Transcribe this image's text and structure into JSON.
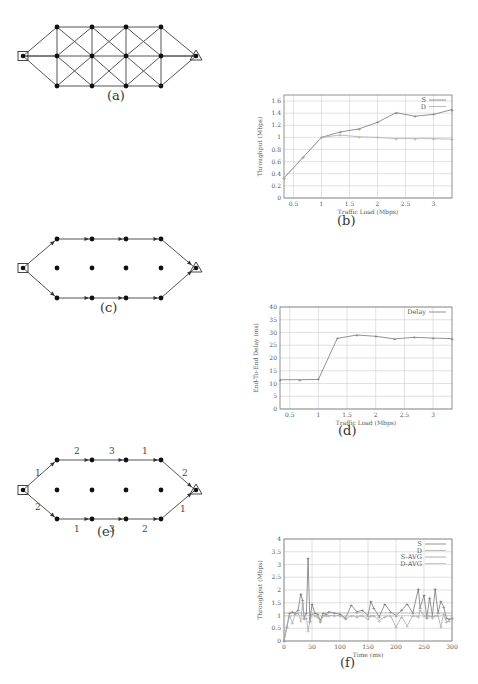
{
  "figure": {
    "panels": [
      {
        "id": "a",
        "caption": "(a)",
        "type": "diagram",
        "description": "Full mesh grid topology: source square, 3x4 relay nodes, destination triangle"
      },
      {
        "id": "b",
        "caption": "(b)",
        "type": "chart"
      },
      {
        "id": "c",
        "caption": "(c)",
        "type": "diagram",
        "description": "Two disjoint paths (upper and lower) from source to destination with directed edges"
      },
      {
        "id": "d",
        "caption": "(d)",
        "type": "chart"
      },
      {
        "id": "e",
        "caption": "(e)",
        "type": "diagram",
        "description": "Two paths with channel assignments on each link"
      },
      {
        "id": "f",
        "caption": "(f)",
        "type": "chart"
      }
    ],
    "diagram_e_labels": {
      "upper": [
        "1",
        "2",
        "3",
        "1",
        "2"
      ],
      "lower": [
        "2",
        "1",
        "3",
        "2",
        "1"
      ]
    }
  },
  "chart_data": [
    {
      "panel": "b",
      "type": "line",
      "title": "",
      "xlabel": "Traffic Load (Mbps)",
      "ylabel": "Throughput (Mbps)",
      "xlim": [
        0.33,
        3.33
      ],
      "ylim": [
        0,
        1.7
      ],
      "xticks": [
        "0.5",
        "1",
        "1.5",
        "2",
        "2.5",
        "3"
      ],
      "yticks": [
        "0",
        "0.2",
        "0.4",
        "0.6",
        "0.8",
        "1",
        "1.2",
        "1.4",
        "1.6"
      ],
      "grid": true,
      "legend_position": "top-right",
      "x": [
        0.33,
        0.67,
        1.0,
        1.33,
        1.67,
        2.0,
        2.33,
        2.67,
        3.0,
        3.33
      ],
      "series": [
        {
          "name": "S",
          "values": [
            0.33,
            0.67,
            1.0,
            1.09,
            1.14,
            1.25,
            1.41,
            1.35,
            1.38,
            1.46
          ]
        },
        {
          "name": "D",
          "values": [
            0.33,
            0.67,
            1.0,
            1.04,
            1.01,
            1.0,
            0.98,
            0.98,
            0.98,
            0.97
          ]
        }
      ]
    },
    {
      "panel": "d",
      "type": "line",
      "title": "",
      "xlabel": "Traffic Load (Mbps)",
      "ylabel": "End-To-End Delay (ms)",
      "xlim": [
        0.33,
        3.33
      ],
      "ylim": [
        0,
        40
      ],
      "xticks": [
        "0.5",
        "1",
        "1.5",
        "2",
        "2.5",
        "3"
      ],
      "yticks": [
        "0",
        "5",
        "10",
        "15",
        "20",
        "25",
        "30",
        "35",
        "40"
      ],
      "grid": true,
      "legend_position": "top-right",
      "x": [
        0.33,
        0.67,
        1.0,
        1.33,
        1.67,
        2.0,
        2.33,
        2.67,
        3.0,
        3.33
      ],
      "series": [
        {
          "name": "Delay",
          "values": [
            11.5,
            11.5,
            11.6,
            27.7,
            29.0,
            28.5,
            27.5,
            28.1,
            27.8,
            27.6
          ]
        }
      ]
    },
    {
      "panel": "f",
      "type": "line",
      "title": "",
      "xlabel": "Time (ms)",
      "ylabel": "Throughput (Mbps)",
      "xlim": [
        0,
        300
      ],
      "ylim": [
        0,
        4
      ],
      "xticks": [
        "0",
        "50",
        "100",
        "150",
        "200",
        "250",
        "300"
      ],
      "yticks": [
        "0",
        "0.5",
        "1",
        "1.5",
        "2",
        "2.5",
        "3",
        "3.5",
        "4"
      ],
      "grid": true,
      "legend_position": "top-right",
      "x": [
        0,
        5,
        10,
        15,
        20,
        25,
        30,
        33,
        36,
        40,
        43,
        46,
        50,
        55,
        60,
        65,
        70,
        75,
        80,
        90,
        100,
        110,
        120,
        130,
        140,
        150,
        155,
        160,
        170,
        180,
        190,
        200,
        210,
        220,
        230,
        240,
        243,
        250,
        255,
        260,
        265,
        270,
        275,
        280,
        285,
        290,
        295,
        300
      ],
      "series": [
        {
          "name": "S",
          "values": [
            0,
            0.55,
            1.1,
            1.15,
            1.1,
            1.2,
            1.85,
            1.6,
            0.9,
            1.1,
            3.25,
            0.8,
            1.45,
            1.1,
            1.05,
            0.8,
            1.1,
            1.05,
            1.15,
            1.1,
            1.05,
            0.9,
            1.4,
            1.15,
            1.2,
            1.0,
            1.55,
            1.3,
            0.95,
            1.45,
            1.15,
            1.0,
            1.2,
            1.45,
            1.1,
            2.05,
            1.3,
            1.8,
            0.9,
            1.7,
            1.0,
            2.05,
            1.1,
            1.55,
            1.35,
            0.9,
            0.85,
            0.9
          ]
        },
        {
          "name": "D",
          "values": [
            0,
            0.55,
            1.0,
            0.7,
            1.05,
            1.1,
            0.8,
            1.5,
            0.85,
            0.9,
            0.4,
            0.75,
            1.05,
            1.0,
            0.95,
            0.75,
            1.0,
            1.0,
            1.0,
            1.0,
            1.0,
            0.85,
            1.0,
            0.95,
            1.0,
            0.85,
            1.0,
            1.0,
            0.8,
            0.95,
            1.0,
            0.55,
            0.95,
            0.6,
            1.0,
            0.95,
            1.2,
            1.0,
            0.95,
            1.0,
            0.9,
            1.0,
            1.0,
            0.55,
            1.05,
            0.75,
            0.8,
            0.9
          ]
        },
        {
          "name": "S-AVG",
          "values": [
            1.1
          ]
        },
        {
          "name": "D-AVG",
          "values": [
            0.98
          ]
        }
      ]
    }
  ]
}
